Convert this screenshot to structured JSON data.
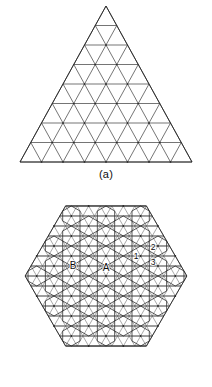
{
  "figure": {
    "panels": [
      {
        "id": "panel-a",
        "caption": "(a)",
        "kind": "triangular-lattice-triangle",
        "rows": 8,
        "description": "Equilateral triangle subdivided into a triangular lattice of 8 rows"
      },
      {
        "id": "panel-b",
        "caption": "(b)",
        "kind": "hexagon-rhombille-tiling",
        "description": "Hexagonal region tiled with hexagons and rhombi over a triangular lattice",
        "labels": [
          {
            "text": "B",
            "x": 73,
            "y": 79
          },
          {
            "text": "A",
            "x": 106,
            "y": 81
          },
          {
            "text": "1",
            "x": 136,
            "y": 69
          },
          {
            "text": "2",
            "x": 153,
            "y": 60
          },
          {
            "text": "3",
            "x": 153,
            "y": 75
          }
        ]
      }
    ]
  },
  "geometry": {
    "triangle": {
      "apex_x": 106,
      "apex_y": 6,
      "base_y": 162,
      "half_base": 86,
      "rows": 8
    },
    "hexagon": {
      "center_x": 106,
      "center_y": 86,
      "radius_x": 92,
      "radius_y": 82,
      "cell": 11.6
    }
  },
  "colors": {
    "ink": "#2e2e2e",
    "soft_ink": "#6e6e6e",
    "background": "#ffffff",
    "label": "#0d0d0d"
  },
  "chart_data": {
    "type": "diagram",
    "title": "",
    "panels": [
      "(a)",
      "(b)"
    ],
    "annotations": [
      "A",
      "B",
      "1",
      "2",
      "3"
    ]
  }
}
